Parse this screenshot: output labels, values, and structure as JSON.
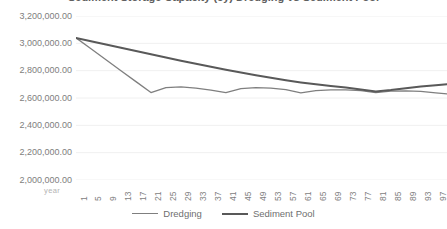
{
  "chart_data": {
    "type": "line",
    "title": "Sediment Storage Capacity (cy) Dredging vs Sediment Pool",
    "xlabel": "year",
    "ylabel": "",
    "grid": true,
    "legend_position": "bottom",
    "ylim": [
      2000000,
      3200000
    ],
    "xlim": [
      1,
      100
    ],
    "ytick_labels": [
      "3,200,000.00",
      "3,000,000.00",
      "2,800,000.00",
      "2,600,000.00",
      "2,400,000.00",
      "2,200,000.00",
      "2,000,000.00"
    ],
    "ytick_values": [
      3200000,
      3000000,
      2800000,
      2600000,
      2400000,
      2200000,
      2000000
    ],
    "xtick_labels": [
      "1",
      "5",
      "9",
      "13",
      "17",
      "21",
      "25",
      "29",
      "33",
      "37",
      "41",
      "45",
      "49",
      "53",
      "57",
      "61",
      "65",
      "69",
      "73",
      "77",
      "81",
      "85",
      "89",
      "93",
      "97"
    ],
    "xtick_values": [
      1,
      5,
      9,
      13,
      17,
      21,
      25,
      29,
      33,
      37,
      41,
      45,
      49,
      53,
      57,
      61,
      65,
      69,
      73,
      77,
      81,
      85,
      89,
      93,
      97
    ],
    "colors": {
      "dredging": "#7f7f7f",
      "sediment_pool": "#595959",
      "gridline": "#f0f0f0",
      "text": "#7e7e7e"
    },
    "series": [
      {
        "name": "Dredging",
        "color": "#7f7f7f",
        "width": 1.3,
        "x": [
          1,
          5,
          9,
          13,
          17,
          21,
          25,
          29,
          33,
          37,
          41,
          45,
          49,
          53,
          57,
          61,
          65,
          69,
          73,
          77,
          81,
          85,
          89,
          93,
          97,
          100
        ],
        "values": [
          3040000,
          2960000,
          2880000,
          2800000,
          2720000,
          2640000,
          2676000,
          2682000,
          2672000,
          2658000,
          2640000,
          2668000,
          2676000,
          2672000,
          2662000,
          2638000,
          2654000,
          2660000,
          2660000,
          2654000,
          2640000,
          2650000,
          2652000,
          2648000,
          2638000,
          2630000
        ]
      },
      {
        "name": "Sediment Pool",
        "color": "#595959",
        "width": 2.0,
        "x": [
          1,
          5,
          9,
          13,
          17,
          21,
          25,
          29,
          33,
          37,
          41,
          45,
          49,
          53,
          57,
          61,
          65,
          69,
          73,
          77,
          81,
          85,
          89,
          93,
          97,
          100
        ],
        "values": [
          3040000,
          3016000,
          2992000,
          2968000,
          2944000,
          2920000,
          2896000,
          2872000,
          2850000,
          2828000,
          2806000,
          2786000,
          2766000,
          2748000,
          2730000,
          2714000,
          2700000,
          2688000,
          2676000,
          2662000,
          2648000,
          2658000,
          2672000,
          2684000,
          2694000,
          2700000
        ]
      }
    ]
  },
  "legend": {
    "items": [
      {
        "label": "Dredging"
      },
      {
        "label": "Sediment Pool"
      }
    ]
  }
}
